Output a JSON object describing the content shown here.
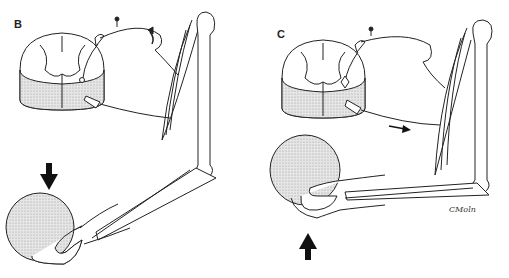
{
  "figure": {
    "panels": [
      {
        "id": "B",
        "label": "B",
        "arrow_direction": "down",
        "description": "Weight dropped into hand stretches biceps; stretch reflex afferent signal (curved arrow toward cord)"
      },
      {
        "id": "C",
        "label": "C",
        "arrow_direction": "up",
        "description": "Motor neuron efferent signal to biceps (straight arrow toward muscle); hand lifts ball"
      }
    ],
    "signature": "CMoln",
    "colors": {
      "line": "#222222",
      "stipple": "#c8c8c8",
      "background": "#ffffff"
    }
  }
}
